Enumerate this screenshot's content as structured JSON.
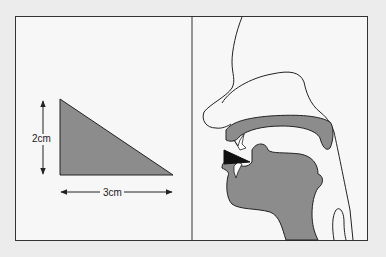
{
  "figure": {
    "left_panel": {
      "height_label": "2cm",
      "width_label": "3cm",
      "shape": "right-triangle",
      "fill_color": "#8c8c8c"
    },
    "right_panel": {
      "subject": "sagittal head section with tongue and mouth",
      "fill_color": "#8c8c8c",
      "highlight_color": "#111111"
    },
    "colors": {
      "background": "#ececec",
      "panel": "#f7f7f7",
      "stroke": "#222222"
    }
  }
}
